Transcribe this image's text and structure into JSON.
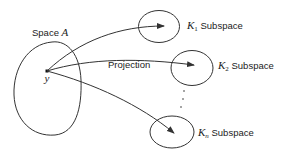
{
  "diagram": {
    "type": "projection-diagram",
    "source_space": {
      "label_prefix": "Space ",
      "label_var": "A",
      "point_label": "y"
    },
    "edge_label": "Projection",
    "subspaces": [
      {
        "var": "K",
        "index": "1",
        "suffix": " Subspace"
      },
      {
        "var": "K",
        "index": "2",
        "suffix": " Subspace"
      },
      {
        "var": "K",
        "index": "n",
        "suffix": " Subspace"
      }
    ],
    "ellipsis": "⋮",
    "colors": {
      "stroke": "#333333",
      "text": "#222222",
      "background": "#ffffff"
    }
  }
}
